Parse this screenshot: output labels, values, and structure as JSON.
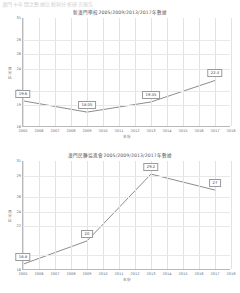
{
  "topstrip": {
    "ghost_text": "澳門十年間之數據比較與分析研究報告"
  },
  "charts": [
    {
      "id": "chart1",
      "title": "新澳門學校2005/2009/2013/2017年數據",
      "yaxis_label": "百分比",
      "xaxis_label": "年份",
      "chart_data": {
        "type": "line",
        "title": "新澳門學校2005/2009/2013/2017年數據",
        "xlabel": "年份",
        "ylabel": "百分比",
        "x": [
          2005,
          2006,
          2007,
          2008,
          2009,
          2010,
          2011,
          2012,
          2013,
          2014,
          2015,
          2016,
          2017,
          2018
        ],
        "xticks": [
          "2005",
          "2006",
          "2007",
          "2008",
          "2009",
          "2010",
          "2011",
          "2012",
          "2013",
          "2014",
          "2015",
          "2016",
          "2017",
          "2018"
        ],
        "yticks": [
          16,
          19,
          21,
          24,
          26,
          28,
          31
        ],
        "ylim": [
          16,
          31
        ],
        "xlim": [
          2005,
          2018
        ],
        "grid": true,
        "legend": "none",
        "series": [
          {
            "name": "新澳門學校",
            "points": [
              {
                "x": 2005,
                "y": 19.6,
                "label": "19.6"
              },
              {
                "x": 2009,
                "y": 18.05,
                "label": "18.05"
              },
              {
                "x": 2013,
                "y": 19.45,
                "label": "19.45"
              },
              {
                "x": 2017,
                "y": 22.4,
                "label": "22.4"
              }
            ]
          }
        ]
      }
    },
    {
      "id": "chart2",
      "title": "澳門politik團協進會2005/2009/2013/2017年數據",
      "yaxis_label": "百分比",
      "xaxis_label": "年份",
      "chart_data": {
        "type": "line",
        "title": "澳門民聯協進會2005/2009/2013/2017年數據",
        "xlabel": "年份",
        "ylabel": "百分比",
        "x": [
          2005,
          2006,
          2007,
          2008,
          2009,
          2010,
          2011,
          2012,
          2013,
          2014,
          2015,
          2016,
          2017,
          2018
        ],
        "xticks": [
          "2005",
          "2006",
          "2007",
          "2008",
          "2009",
          "2010",
          "2011",
          "2012",
          "2013",
          "2014",
          "2015",
          "2016",
          "2017",
          "2018"
        ],
        "yticks": [
          16,
          18,
          22,
          24,
          26,
          29,
          31
        ],
        "ylim": [
          16,
          31
        ],
        "xlim": [
          2005,
          2018
        ],
        "grid": true,
        "legend": "none",
        "series": [
          {
            "name": "澳門民聯協進會",
            "points": [
              {
                "x": 2005,
                "y": 16.8,
                "label": "16.8"
              },
              {
                "x": 2009,
                "y": 20.0,
                "label": "20"
              },
              {
                "x": 2013,
                "y": 29.2,
                "label": "29.2"
              },
              {
                "x": 2017,
                "y": 27.0,
                "label": "27"
              }
            ]
          }
        ]
      }
    }
  ]
}
